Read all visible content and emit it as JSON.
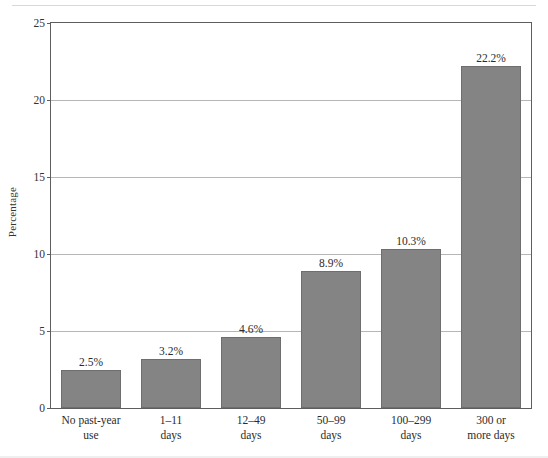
{
  "figure": {
    "background_color": "#ffffff",
    "bar_color": "#848484",
    "bar_border_color": "#6e6e6e",
    "gridline_color": "#b6b6b6",
    "axis_color": "#5d5d5d"
  },
  "chart_data": {
    "type": "bar",
    "title": "",
    "xlabel": "",
    "ylabel": "Percentage",
    "categories": [
      "No past-year use",
      "1–11 days",
      "12–49 days",
      "50–99 days",
      "100–299 days",
      "300 or more days"
    ],
    "category_lines": [
      {
        "line1": "No past-year",
        "line2": "use"
      },
      {
        "line1": "1–11",
        "line2": "days"
      },
      {
        "line1": "12–49",
        "line2": "days"
      },
      {
        "line1": "50–99",
        "line2": "days"
      },
      {
        "line1": "100–299",
        "line2": "days"
      },
      {
        "line1": "300 or",
        "line2": "more days"
      }
    ],
    "values": [
      2.5,
      3.2,
      4.6,
      8.9,
      10.3,
      22.2
    ],
    "data_labels": [
      "2.5%",
      "3.2%",
      "4.6%",
      "8.9%",
      "10.3%",
      "22.2%"
    ],
    "ylim": [
      0,
      25
    ],
    "yticks": [
      0,
      5,
      10,
      15,
      20,
      25
    ],
    "ytick_labels": [
      "0",
      "5",
      "10",
      "15",
      "20",
      "25"
    ],
    "grid": "horizontal",
    "legend": "none"
  }
}
